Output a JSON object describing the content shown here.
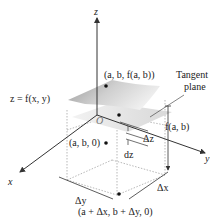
{
  "diagram": {
    "axes": {
      "z": "z",
      "x": "x",
      "y": "y",
      "origin": "O"
    },
    "labels": {
      "point_top": "(a, b, f(a, b))",
      "surface": "z = f(x, y)",
      "tangent_line1": "Tangent",
      "tangent_line2": "plane",
      "height": "f(a, b)",
      "delta_z": "Δz",
      "dz": "dz",
      "point_base": "(a, b, 0)",
      "delta_x": "Δx",
      "delta_y": "Δy",
      "point_shifted": "(a + Δx, b + Δy, 0)"
    },
    "colors": {
      "axis": "#333333",
      "dotted": "#999999",
      "surface_light": "#e6e6e6",
      "surface_dark": "#9a9a9a"
    }
  }
}
